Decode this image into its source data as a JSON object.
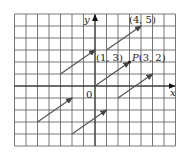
{
  "figure": {
    "axes": {
      "x_label": "x",
      "y_label": "y",
      "origin_label": "0"
    },
    "grid": {
      "x_min": -7,
      "x_max": 7,
      "y_min": -5,
      "y_max": 6,
      "origin_px": [
        95,
        86
      ],
      "unit_x_px": 11.5,
      "unit_y_px": 12
    },
    "points": [
      {
        "name": "point-1-3",
        "label": "(1, 3)",
        "x": 1,
        "y": 3
      },
      {
        "name": "point-4-5",
        "label": "(4, 5)",
        "x": 4,
        "y": 5
      },
      {
        "name": "point-P",
        "label_letter": "P",
        "label_coords": "(3, 2)",
        "x": 3,
        "y": 2
      }
    ],
    "vectors": [
      {
        "name": "vector-1-3-to-4-5",
        "from": [
          1,
          3
        ],
        "to": [
          4,
          5
        ]
      },
      {
        "name": "vector-origin-to-P",
        "from": [
          0,
          0
        ],
        "to": [
          3,
          2
        ]
      },
      {
        "name": "vector-neg3-1-to-0-3",
        "from": [
          -3,
          1
        ],
        "to": [
          0,
          3
        ]
      },
      {
        "name": "vector-2-neg1-to-5-1",
        "from": [
          2,
          -1
        ],
        "to": [
          5,
          1
        ]
      },
      {
        "name": "vector-neg5-neg3-to-neg2-neg1",
        "from": [
          -5,
          -3
        ],
        "to": [
          -2,
          -1
        ]
      },
      {
        "name": "vector-neg2-neg4-to-1-neg2",
        "from": [
          -2,
          -4
        ],
        "to": [
          1,
          -2
        ]
      }
    ],
    "colors": {
      "grid": "#555555",
      "axis": "#222222",
      "vector": "#555555",
      "text": "#222222"
    }
  }
}
